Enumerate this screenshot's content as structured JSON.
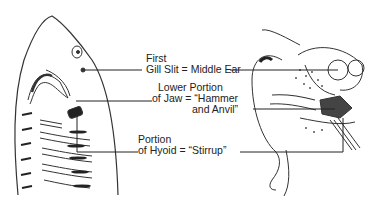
{
  "figure": {
    "left_subject": "shark head",
    "right_subject": "human ear",
    "labels": [
      {
        "line1": "First",
        "line2": "Gill Slit = Middle Ear",
        "line3": ""
      },
      {
        "line1": "Lower Portion",
        "line2": "of Jaw = “Hammer",
        "line3": "and Anvil”"
      },
      {
        "line1": "Portion",
        "line2": "of Hyoid = “Stirrup”",
        "line3": ""
      }
    ]
  }
}
